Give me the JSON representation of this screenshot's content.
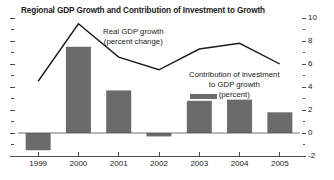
{
  "chart_data": {
    "type": "bar",
    "title": "Regional GDP Growth and Contribution of Investment to Growth",
    "xlabel": "",
    "ylabel": "",
    "categories": [
      "1999",
      "2000",
      "2001",
      "2002",
      "2003",
      "2004",
      "2005"
    ],
    "ylim": [
      -2,
      10
    ],
    "y_ticks": [
      -2,
      0,
      2,
      4,
      6,
      8,
      10
    ],
    "y_ticks_labels": [
      "-2",
      "0",
      "2",
      "4",
      "6",
      "8",
      "10"
    ],
    "y_axis_position": "right",
    "grid": false,
    "legend_position": "inside-annotations",
    "series": [
      {
        "name": "Contribution of investment to GDP growth (percent)",
        "type": "bar",
        "color": "#6b6b6b",
        "values": [
          -1.5,
          7.5,
          3.7,
          -0.3,
          2.8,
          2.9,
          1.8
        ]
      },
      {
        "name": "Real GDP growth (percent change)",
        "type": "line",
        "color": "#1a1a1a",
        "values": [
          4.5,
          9.5,
          6.6,
          5.5,
          7.3,
          7.8,
          6.0
        ]
      }
    ],
    "annotations": [
      {
        "id": "line-annotation",
        "lines": [
          "Real GDP growth",
          "(percent change)"
        ]
      },
      {
        "id": "bar-annotation",
        "lines": [
          "Contribution of investment",
          "to GDP growth",
          "(percent)"
        ]
      }
    ]
  },
  "colors": {
    "bar": "#6b6b6b",
    "line": "#1a1a1a",
    "axis": "#4d4d4d",
    "text": "#1a1a1a",
    "background": "#ffffff"
  }
}
